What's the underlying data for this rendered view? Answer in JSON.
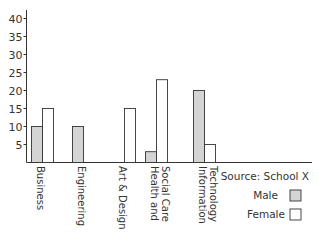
{
  "chart_data": {
    "type": "bar",
    "title": "",
    "xlabel": "",
    "ylabel": "",
    "ylim": [
      0,
      40
    ],
    "yticks": [
      5,
      10,
      15,
      20,
      25,
      30,
      35,
      40
    ],
    "grid": false,
    "categories": [
      [
        "Business"
      ],
      [
        "Engineering"
      ],
      [
        "Art & Design"
      ],
      [
        "Health and",
        "Social Care"
      ],
      [
        "Information",
        "Technology"
      ]
    ],
    "category_names": [
      "Business",
      "Engineering",
      "Art & Design",
      "Health and Social Care",
      "Information Technology"
    ],
    "series": [
      {
        "name": "Male",
        "values": [
          10,
          10,
          0,
          3,
          20
        ],
        "color": "#d4d4d4"
      },
      {
        "name": "Female",
        "values": [
          15,
          0,
          15,
          23,
          5
        ],
        "color": "#ffffff"
      }
    ],
    "annotation": "Source: School X",
    "legend_position": "bottom-right"
  }
}
